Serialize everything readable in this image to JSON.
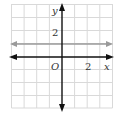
{
  "graph": {
    "x_axis_label": "x",
    "y_axis_label": "y",
    "origin_label": "O",
    "x_tick_label": "2",
    "y_tick_label": "2",
    "grid": {
      "x_min": -4,
      "x_max": 4,
      "y_min": -4,
      "y_max": 4,
      "step": 1
    },
    "line": {
      "equation": "y = 1",
      "y_value": 1,
      "color": "#999999"
    },
    "colors": {
      "grid": "#d9d9d9",
      "axes": "#111111",
      "line": "#9a9a9a"
    }
  }
}
